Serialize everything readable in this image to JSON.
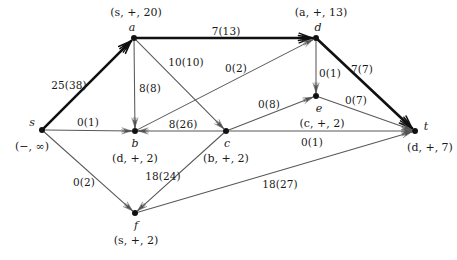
{
  "diagram": {
    "type": "directed-graph",
    "colors": {
      "background": "#ffffff",
      "edge": "#58585a",
      "edge_bold": "#111111",
      "node": "#111111",
      "text": "#1a1a1a"
    },
    "nodes": [
      {
        "id": "s",
        "name": "s",
        "label": "(−, ∞)",
        "x": 42,
        "y": 130,
        "name_dx": -10,
        "name_dy": -8,
        "label_dx": -10,
        "label_dy": 16
      },
      {
        "id": "a",
        "name": "a",
        "label": "(s, +, 20)",
        "x": 134,
        "y": 38,
        "name_dx": -2,
        "name_dy": -11,
        "label_dx": 2,
        "label_dy": -26
      },
      {
        "id": "b",
        "name": "b",
        "label": "(d, +, 2)",
        "x": 135,
        "y": 131,
        "name_dx": 0,
        "name_dy": 12,
        "label_dx": 0,
        "label_dy": 27
      },
      {
        "id": "c",
        "name": "c",
        "label": "(b, +, 2)",
        "x": 226,
        "y": 131,
        "name_dx": 1,
        "name_dy": 12,
        "label_dx": 0,
        "label_dy": 27
      },
      {
        "id": "d",
        "name": "d",
        "label": "(a, +, 13)",
        "x": 316,
        "y": 38,
        "name_dx": 2,
        "name_dy": -11,
        "label_dx": 5,
        "label_dy": -26
      },
      {
        "id": "e",
        "name": "e",
        "label": "(c, +, 2)",
        "x": 316,
        "y": 96,
        "name_dx": 3,
        "name_dy": 12,
        "label_dx": 6,
        "label_dy": 27
      },
      {
        "id": "f",
        "name": "f",
        "label": "(s, +, 2)",
        "x": 135,
        "y": 213,
        "name_dx": 1,
        "name_dy": 12,
        "label_dx": 1,
        "label_dy": 27
      },
      {
        "id": "t",
        "name": "t",
        "label": "(d, +, 7)",
        "x": 415,
        "y": 131,
        "name_dx": 11,
        "name_dy": -5,
        "label_dx": 15,
        "label_dy": 16
      }
    ],
    "edges": [
      {
        "id": "s-a",
        "from": "s",
        "to": "a",
        "flow": 25,
        "capacity": 38,
        "label": "25(38)",
        "bold": true,
        "label_x": 69,
        "label_y": 85
      },
      {
        "id": "a-d",
        "from": "a",
        "to": "d",
        "flow": 7,
        "capacity": 13,
        "label": "7(13)",
        "bold": true,
        "label_x": 226,
        "label_y": 31
      },
      {
        "id": "d-t",
        "from": "d",
        "to": "t",
        "flow": 7,
        "capacity": 7,
        "label": "7(7)",
        "bold": true,
        "label_x": 362,
        "label_y": 69
      },
      {
        "id": "a-b",
        "from": "a",
        "to": "b",
        "flow": 8,
        "capacity": 8,
        "label": "8(8)",
        "bold": false,
        "label_x": 150,
        "label_y": 88
      },
      {
        "id": "a-c",
        "from": "a",
        "to": "c",
        "flow": 10,
        "capacity": 10,
        "label": "10(10)",
        "bold": false,
        "label_x": 186,
        "label_y": 62
      },
      {
        "id": "b-d",
        "from": "b",
        "to": "d",
        "flow": 0,
        "capacity": 2,
        "label": "0(2)",
        "bold": false,
        "label_x": 236,
        "label_y": 68
      },
      {
        "id": "d-e",
        "from": "d",
        "to": "e",
        "flow": 0,
        "capacity": 1,
        "label": "0(1)",
        "bold": false,
        "label_x": 330,
        "label_y": 73
      },
      {
        "id": "s-b",
        "from": "s",
        "to": "b",
        "flow": 0,
        "capacity": 1,
        "label": "0(1)",
        "bold": false,
        "label_x": 88,
        "label_y": 122
      },
      {
        "id": "c-b",
        "from": "c",
        "to": "b",
        "flow": 8,
        "capacity": 26,
        "label": "8(26)",
        "bold": false,
        "label_x": 183,
        "label_y": 124
      },
      {
        "id": "c-e",
        "from": "c",
        "to": "e",
        "flow": 0,
        "capacity": 8,
        "label": "0(8)",
        "bold": false,
        "label_x": 269,
        "label_y": 104
      },
      {
        "id": "e-t",
        "from": "e",
        "to": "t",
        "flow": 0,
        "capacity": 7,
        "label": "0(7)",
        "bold": false,
        "label_x": 356,
        "label_y": 100
      },
      {
        "id": "c-t",
        "from": "c",
        "to": "t",
        "flow": 0,
        "capacity": 1,
        "label": "0(1)",
        "bold": false,
        "label_x": 312,
        "label_y": 142
      },
      {
        "id": "s-f",
        "from": "s",
        "to": "f",
        "flow": 0,
        "capacity": 2,
        "label": "0(2)",
        "bold": false,
        "label_x": 84,
        "label_y": 182
      },
      {
        "id": "c-f",
        "from": "c",
        "to": "f",
        "flow": 18,
        "capacity": 24,
        "label": "18(24)",
        "bold": false,
        "label_x": 163,
        "label_y": 176
      },
      {
        "id": "f-t",
        "from": "f",
        "to": "t",
        "flow": 18,
        "capacity": 27,
        "label": "18(27)",
        "bold": false,
        "label_x": 280,
        "label_y": 184
      }
    ]
  }
}
